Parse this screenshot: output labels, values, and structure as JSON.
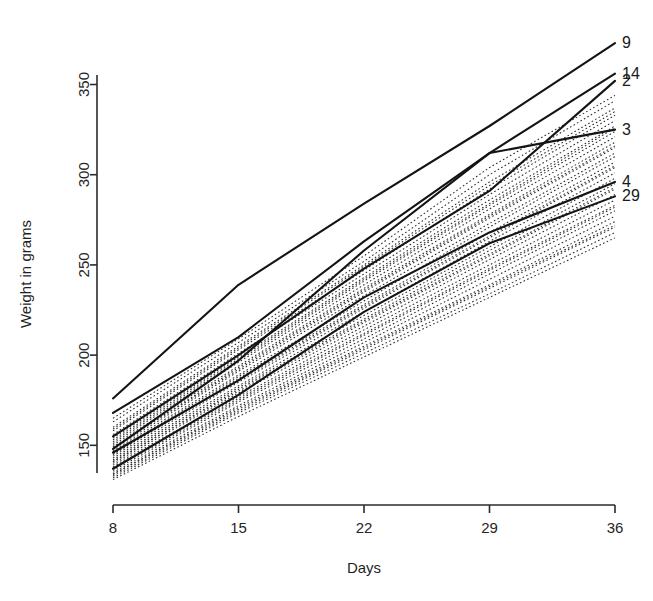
{
  "chart_data": {
    "type": "line",
    "title": "",
    "xlabel": "Days",
    "ylabel": "Weight in grams",
    "x": [
      8,
      15,
      22,
      29,
      36
    ],
    "xticks": [
      8,
      15,
      22,
      29,
      36
    ],
    "xticklabels": [
      "8",
      "15",
      "22",
      "29",
      "36"
    ],
    "yticks": [
      150,
      200,
      250,
      300,
      350
    ],
    "yticklabels": [
      "150",
      "200",
      "250",
      "300",
      "350"
    ],
    "xlim": [
      8,
      36
    ],
    "ylim": [
      128,
      378
    ],
    "grid": false,
    "legend": "line-end-labels",
    "highlight_style": "solid",
    "background_style": "dotted",
    "series": [
      {
        "name": "9",
        "label": "9",
        "style": "solid",
        "values": [
          176,
          239,
          284,
          327,
          373
        ]
      },
      {
        "name": "14",
        "label": "14",
        "style": "solid",
        "values": [
          168,
          210,
          263,
          312,
          356
        ]
      },
      {
        "name": "2",
        "label": "2",
        "style": "solid",
        "values": [
          155,
          200,
          248,
          291,
          352
        ]
      },
      {
        "name": "3",
        "label": "3",
        "style": "solid",
        "values": [
          148,
          197,
          258,
          312,
          325
        ]
      },
      {
        "name": "4",
        "label": "4",
        "style": "solid",
        "values": [
          146,
          186,
          232,
          268,
          296
        ]
      },
      {
        "name": "29",
        "label": "29",
        "style": "solid",
        "values": [
          137,
          178,
          224,
          262,
          288
        ]
      },
      {
        "name": "b1",
        "label": "",
        "style": "dotted",
        "values": [
          163,
          207,
          252,
          300,
          341
        ]
      },
      {
        "name": "b2",
        "label": "",
        "style": "dotted",
        "values": [
          160,
          205,
          250,
          296,
          337
        ]
      },
      {
        "name": "b3",
        "label": "",
        "style": "dotted",
        "values": [
          158,
          203,
          247,
          292,
          333
        ]
      },
      {
        "name": "b4",
        "label": "",
        "style": "dotted",
        "values": [
          156,
          201,
          245,
          289,
          330
        ]
      },
      {
        "name": "b5",
        "label": "",
        "style": "dotted",
        "values": [
          154,
          199,
          243,
          286,
          327
        ]
      },
      {
        "name": "b6",
        "label": "",
        "style": "dotted",
        "values": [
          152,
          197,
          241,
          283,
          324
        ]
      },
      {
        "name": "b7",
        "label": "",
        "style": "dotted",
        "values": [
          151,
          196,
          239,
          281,
          321
        ]
      },
      {
        "name": "b8",
        "label": "",
        "style": "dotted",
        "values": [
          150,
          194,
          237,
          278,
          318
        ]
      },
      {
        "name": "b9",
        "label": "",
        "style": "dotted",
        "values": [
          149,
          192,
          235,
          276,
          315
        ]
      },
      {
        "name": "b10",
        "label": "",
        "style": "dotted",
        "values": [
          148,
          191,
          233,
          273,
          312
        ]
      },
      {
        "name": "b11",
        "label": "",
        "style": "dotted",
        "values": [
          147,
          189,
          230,
          271,
          310
        ]
      },
      {
        "name": "b12",
        "label": "",
        "style": "dotted",
        "values": [
          146,
          188,
          228,
          268,
          307
        ]
      },
      {
        "name": "b13",
        "label": "",
        "style": "dotted",
        "values": [
          145,
          186,
          226,
          265,
          304
        ]
      },
      {
        "name": "b14",
        "label": "",
        "style": "dotted",
        "values": [
          144,
          185,
          224,
          263,
          301
        ]
      },
      {
        "name": "b15",
        "label": "",
        "style": "dotted",
        "values": [
          143,
          183,
          222,
          260,
          298
        ]
      },
      {
        "name": "b16",
        "label": "",
        "style": "dotted",
        "values": [
          142,
          182,
          220,
          258,
          295
        ]
      },
      {
        "name": "b17",
        "label": "",
        "style": "dotted",
        "values": [
          141,
          180,
          218,
          255,
          292
        ]
      },
      {
        "name": "b18",
        "label": "",
        "style": "dotted",
        "values": [
          140,
          179,
          216,
          253,
          289
        ]
      },
      {
        "name": "b19",
        "label": "",
        "style": "dotted",
        "values": [
          139,
          177,
          214,
          250,
          286
        ]
      },
      {
        "name": "b20",
        "label": "",
        "style": "dotted",
        "values": [
          138,
          176,
          212,
          248,
          283
        ]
      },
      {
        "name": "b21",
        "label": "",
        "style": "dotted",
        "values": [
          136,
          174,
          209,
          245,
          280
        ]
      },
      {
        "name": "b22",
        "label": "",
        "style": "dotted",
        "values": [
          135,
          172,
          207,
          242,
          277
        ]
      },
      {
        "name": "b23",
        "label": "",
        "style": "dotted",
        "values": [
          134,
          171,
          205,
          239,
          274
        ]
      },
      {
        "name": "b24",
        "label": "",
        "style": "dotted",
        "values": [
          133,
          169,
          203,
          237,
          271
        ]
      },
      {
        "name": "b25",
        "label": "",
        "style": "dotted",
        "values": [
          132,
          168,
          201,
          234,
          268
        ]
      },
      {
        "name": "b26",
        "label": "",
        "style": "dotted",
        "values": [
          165,
          209,
          255,
          304,
          344
        ]
      },
      {
        "name": "b27",
        "label": "",
        "style": "dotted",
        "values": [
          159,
          204,
          249,
          294,
          335
        ]
      },
      {
        "name": "b28",
        "label": "",
        "style": "dotted",
        "values": [
          153,
          198,
          242,
          284,
          326
        ]
      },
      {
        "name": "b29",
        "label": "",
        "style": "dotted",
        "values": [
          149,
          193,
          236,
          277,
          316
        ]
      },
      {
        "name": "b30",
        "label": "",
        "style": "dotted",
        "values": [
          145,
          187,
          227,
          266,
          305
        ]
      },
      {
        "name": "b31",
        "label": "",
        "style": "dotted",
        "values": [
          141,
          181,
          219,
          256,
          293
        ]
      },
      {
        "name": "b32",
        "label": "",
        "style": "dotted",
        "values": [
          137,
          175,
          211,
          247,
          282
        ]
      },
      {
        "name": "b33",
        "label": "",
        "style": "dotted",
        "values": [
          134,
          170,
          204,
          238,
          272
        ]
      },
      {
        "name": "b34",
        "label": "",
        "style": "dotted",
        "values": [
          131,
          166,
          199,
          232,
          265
        ]
      }
    ]
  },
  "plot_geometry": {
    "left": 113,
    "right": 615,
    "top": 34,
    "bottom": 485,
    "axis_y_top": 75,
    "axis_y_bottom": 473,
    "axis_x_y": 505,
    "xlabel_y": 573,
    "ylabel_x": 31
  },
  "colors": {
    "line": "#141414",
    "dotted": "#2a2a2a",
    "axis": "#2b2b2b",
    "text": "#1f1f1f",
    "background": "#ffffff"
  }
}
